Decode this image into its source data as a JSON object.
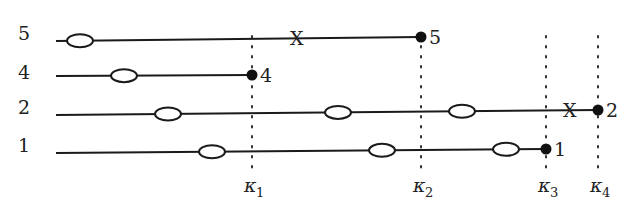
{
  "diagram": {
    "rows": [
      {
        "label": "5",
        "y0": 41,
        "y1": 37,
        "x_start": 56,
        "x_end": 421,
        "ellipses": [
          80
        ],
        "cross_x": 298,
        "end_label": "5"
      },
      {
        "label": "4",
        "y0": 76,
        "y1": 75,
        "x_start": 56,
        "x_end": 252,
        "ellipses": [
          124
        ],
        "cross_x": null,
        "end_label": "4"
      },
      {
        "label": "2",
        "y0": 115,
        "y1": 110,
        "x_start": 56,
        "x_end": 598,
        "ellipses": [
          168,
          338,
          462
        ],
        "cross_x": 571,
        "end_label": "2"
      },
      {
        "label": "1",
        "y0": 153,
        "y1": 149,
        "x_start": 56,
        "x_end": 546,
        "ellipses": [
          212,
          382,
          506
        ],
        "cross_x": null,
        "end_label": "1"
      }
    ],
    "row_label_x": 24,
    "row_label_y": [
      40,
      79,
      114,
      152
    ],
    "cross_symbol": "X",
    "kappas": [
      {
        "name": "κ",
        "sub": "1",
        "x": 252
      },
      {
        "name": "κ",
        "sub": "2",
        "x": 421
      },
      {
        "name": "κ",
        "sub": "3",
        "x": 546
      },
      {
        "name": "κ",
        "sub": "4",
        "x": 598
      }
    ],
    "kappa_line_top": 36,
    "kappa_line_bottom": 172,
    "kappa_label_y": 192
  }
}
